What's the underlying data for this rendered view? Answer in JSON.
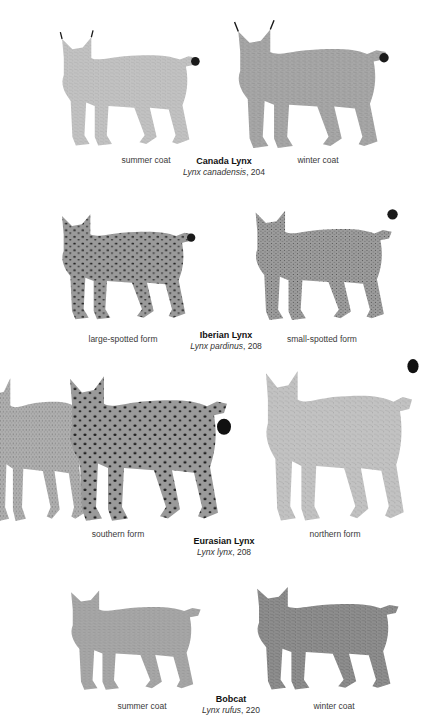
{
  "plates": [
    {
      "common_name": "Canada Lynx",
      "scientific_name": "Lynx canadensis",
      "page": "204",
      "left_label": "summer coat",
      "right_label": "winter coat"
    },
    {
      "common_name": "Iberian Lynx",
      "scientific_name": "Lynx pardinus",
      "page": "208",
      "left_label": "large-spotted form",
      "right_label": "small-spotted form"
    },
    {
      "common_name": "Eurasian Lynx",
      "scientific_name": "Lynx lynx",
      "page": "208",
      "left_label": "southern form",
      "right_label": "northern form"
    },
    {
      "common_name": "Bobcat",
      "scientific_name": "Lynx rufus",
      "page": "220",
      "left_label": "summer coat",
      "right_label": "winter coat"
    }
  ],
  "colors": {
    "background": "#ffffff",
    "text": "#222222",
    "fur_light": "#b8b8b8",
    "fur_mid": "#8a8a8a",
    "fur_dark": "#2a2a2a"
  }
}
